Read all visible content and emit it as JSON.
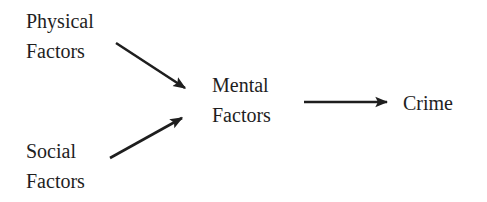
{
  "diagram": {
    "type": "causal-flow",
    "nodes": {
      "physical": {
        "line1": "Physical",
        "line2": "Factors"
      },
      "social": {
        "line1": "Social",
        "line2": "Factors"
      },
      "mental": {
        "line1": "Mental",
        "line2": "Factors"
      },
      "crime": {
        "label": "Crime"
      }
    },
    "edges": [
      {
        "from": "Physical Factors",
        "to": "Mental Factors"
      },
      {
        "from": "Social Factors",
        "to": "Mental Factors"
      },
      {
        "from": "Mental Factors",
        "to": "Crime"
      }
    ],
    "stroke_color": "#1e1e1e"
  }
}
